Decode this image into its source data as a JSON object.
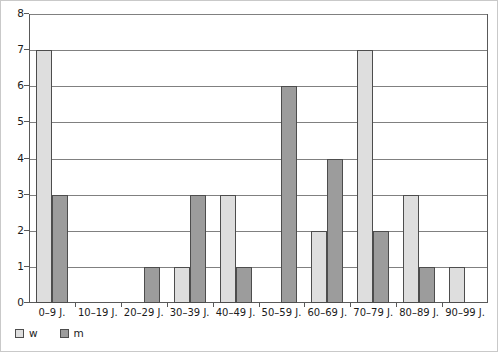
{
  "chart_data": {
    "type": "bar",
    "title": "",
    "subtitle": "",
    "xlabel": "",
    "ylabel": "",
    "ylim": [
      0,
      8
    ],
    "ytick_labels": [
      "0",
      "1",
      "2",
      "3",
      "4",
      "5",
      "6",
      "7",
      "8"
    ],
    "grid": true,
    "grouping": "grouped",
    "legend_position": "bottom-left",
    "categories": [
      "0–9 J.",
      "10–19 J.",
      "20–29 J.",
      "30–39 J.",
      "40–49 J.",
      "50–59 J.",
      "60–69 J.",
      "70–79 J.",
      "80–89 J.",
      "90–99 J."
    ],
    "series": [
      {
        "name": "w",
        "color": "#dedede",
        "values": [
          7,
          0,
          0,
          1,
          3,
          0,
          2,
          7,
          3,
          1
        ]
      },
      {
        "name": "m",
        "color": "#9c9c9c",
        "values": [
          3,
          0,
          1,
          3,
          1,
          6,
          4,
          2,
          1,
          0
        ]
      }
    ]
  },
  "legend": {
    "entries": [
      {
        "label": "w",
        "swatch": "legend-swatch-w"
      },
      {
        "label": "m",
        "swatch": "legend-swatch-m"
      }
    ]
  },
  "colors": {
    "series_w": "#dedede",
    "series_m": "#9c9c9c",
    "bar_outline": "#4d4d4d",
    "gridline": "#808080",
    "axis": "#595959",
    "text": "#1a1a1a",
    "background": "#ffffff",
    "page_border": "#c9c9c9"
  }
}
